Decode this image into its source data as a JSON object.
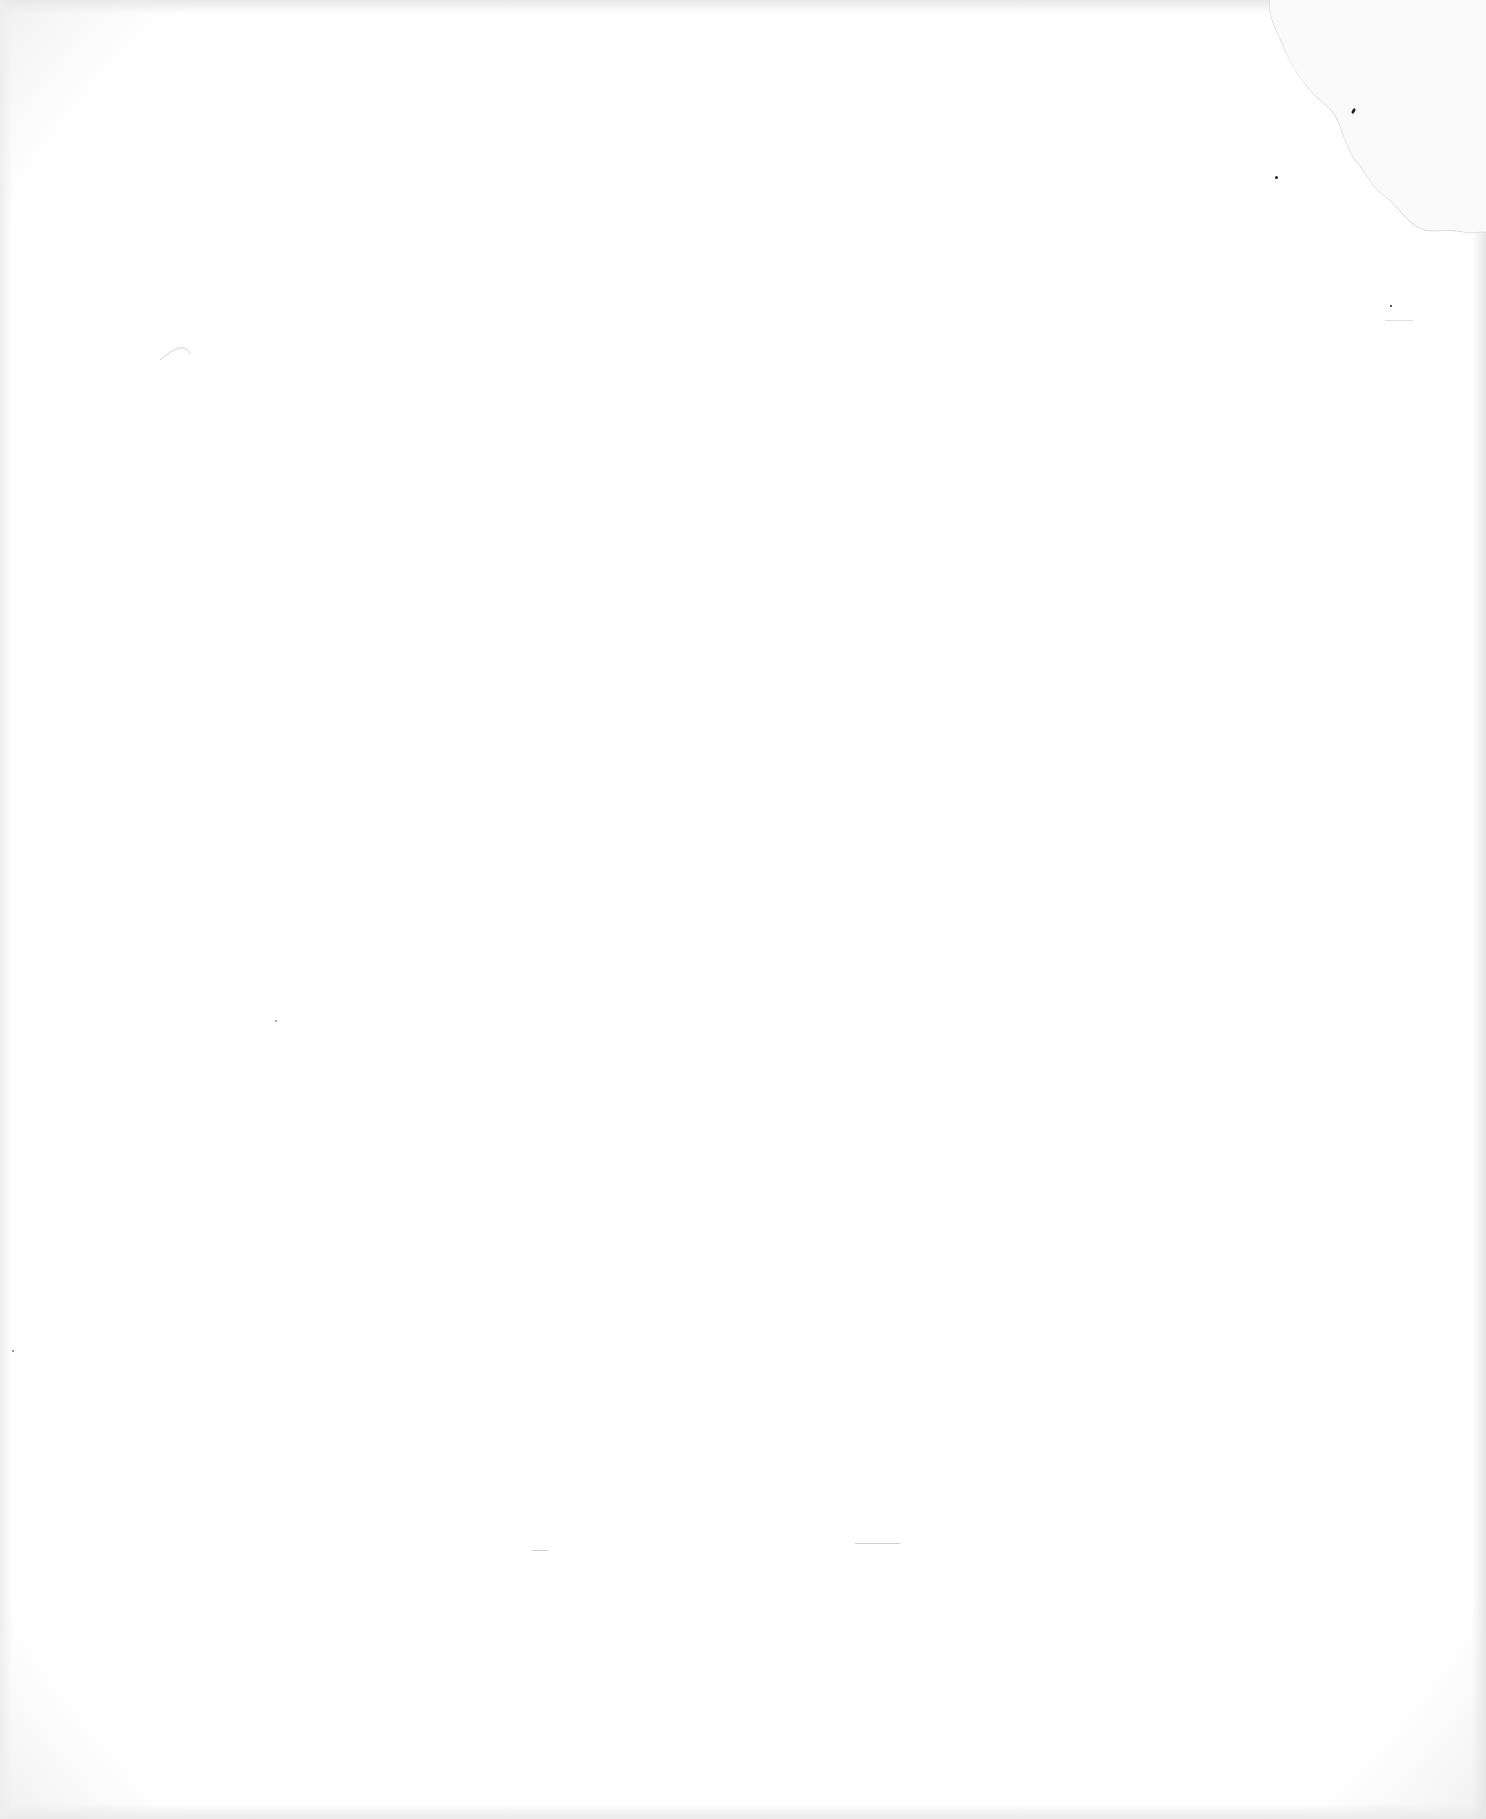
{
  "page": {
    "type": "blank scanned page",
    "text_content": ""
  },
  "colors": {
    "paper": "#ffffff",
    "edge_shadow": "#e8e8e8",
    "stain_line": "#d6d6d6",
    "speck": "#222222"
  }
}
